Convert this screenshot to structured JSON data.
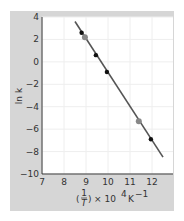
{
  "chart_data": {
    "type": "scatter",
    "title": "",
    "xlabel": "(1/T) × 10^4 K^-1",
    "ylabel": "ln k",
    "xlim": [
      7,
      12.8
    ],
    "ylim": [
      -10,
      4
    ],
    "x_ticks": [
      7,
      8,
      9,
      10,
      11,
      12
    ],
    "y_ticks": [
      4,
      2,
      0,
      -2,
      -4,
      -6,
      -8,
      -10
    ],
    "grid": true,
    "series": [
      {
        "name": "measured points",
        "marker": "black-dot",
        "x": [
          8.8,
          9.45,
          9.95,
          11.95
        ],
        "y": [
          2.6,
          0.6,
          -0.9,
          -6.9
        ]
      },
      {
        "name": "highlighted points",
        "marker": "grey-dot",
        "x": [
          8.95,
          11.4
        ],
        "y": [
          2.2,
          -5.3
        ]
      },
      {
        "name": "fit line",
        "type": "line",
        "x": [
          8.5,
          12.5
        ],
        "y": [
          3.6,
          -8.5
        ]
      }
    ]
  },
  "colors": {
    "panel_bg": "#d6d6d6",
    "plot_bg": "#ffffff",
    "line": "#555555",
    "point_dark": "#111111",
    "point_grey": "#888888"
  },
  "labels": {
    "ylabel": "ln k",
    "xlabel_frac_num": "1",
    "xlabel_frac_den": "T",
    "xlabel_rest": "× 10",
    "xlabel_exp": "4",
    "xlabel_unit": "K",
    "xlabel_unit_exp": "−1"
  },
  "tick_labels": {
    "y": [
      "4",
      "2",
      "0",
      "−2",
      "−4",
      "−6",
      "−8",
      "−10"
    ],
    "x": [
      "7",
      "8",
      "9",
      "10",
      "11",
      "12"
    ]
  }
}
